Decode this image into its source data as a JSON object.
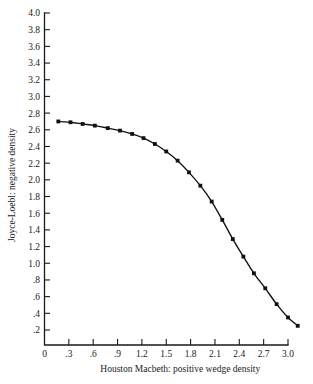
{
  "chart_data": {
    "type": "line",
    "title": "",
    "subtitle": "",
    "xlabel": "Houston Macbeth:  positive wedge density",
    "ylabel": "Joyce-Loebl:  negative density",
    "xlim": [
      0.0,
      3.0
    ],
    "ylim": [
      0.0,
      4.0
    ],
    "grid": false,
    "legend": null,
    "xticks": [
      0.0,
      0.3,
      0.6,
      0.9,
      1.2,
      1.5,
      1.8,
      2.1,
      2.4,
      2.7,
      3.0
    ],
    "xtick_labels": [
      "0",
      ".3",
      ".6",
      ".9",
      "1.2",
      "1.5",
      "1.8",
      "2.1",
      "2.4",
      "2.7",
      "3.0"
    ],
    "yticks": [
      0.2,
      0.4,
      0.6,
      0.8,
      1.0,
      1.2,
      1.4,
      1.6,
      1.8,
      2.0,
      2.2,
      2.4,
      2.6,
      2.8,
      3.0,
      3.2,
      3.4,
      3.6,
      3.8,
      4.0
    ],
    "ytick_labels": [
      ".2",
      ".4",
      ".6",
      ".8",
      "1.0",
      "1.2",
      "1.4",
      "1.6",
      "1.8",
      "2.0",
      "2.2",
      "2.4",
      "2.6",
      "2.8",
      "3.0",
      "3.2",
      "3.4",
      "3.6",
      "3.8",
      "4.0"
    ],
    "marker_style": "filled-square",
    "line_color": "#111111",
    "marker_color": "#111111",
    "series": [
      {
        "name": "calibration curve",
        "x": [
          0.17,
          0.32,
          0.47,
          0.62,
          0.78,
          0.93,
          1.08,
          1.22,
          1.36,
          1.5,
          1.64,
          1.78,
          1.92,
          2.06,
          2.19,
          2.32,
          2.45,
          2.58,
          2.72,
          2.86,
          3.0,
          3.12
        ],
        "y": [
          2.7,
          2.69,
          2.67,
          2.65,
          2.62,
          2.59,
          2.55,
          2.5,
          2.43,
          2.34,
          2.23,
          2.09,
          1.93,
          1.74,
          1.52,
          1.29,
          1.08,
          0.88,
          0.7,
          0.51,
          0.35,
          0.25
        ]
      }
    ]
  }
}
